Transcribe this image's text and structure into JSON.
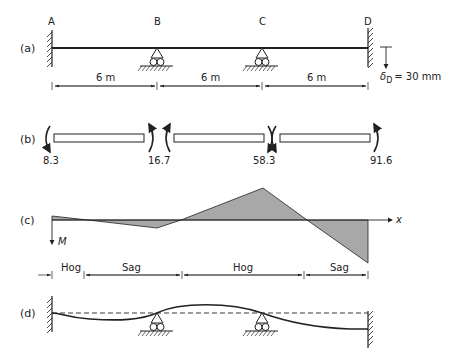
{
  "panels": {
    "a": {
      "label": "(a)",
      "nodes": [
        "A",
        "B",
        "C",
        "D"
      ],
      "spans": [
        "6 m",
        "6 m",
        "6 m"
      ],
      "settlement": {
        "symbol": "δ",
        "subscript": "D",
        "value": "= 30 mm"
      }
    },
    "b": {
      "label": "(b)",
      "moments": [
        "8.3",
        "16.7",
        "58.3",
        "91.6"
      ]
    },
    "c": {
      "label": "(c)",
      "axis_x": "x",
      "axis_m": "M",
      "regions": [
        "Hog",
        "Sag",
        "Hog",
        "Sag"
      ]
    },
    "d": {
      "label": "(d)"
    }
  },
  "colors": {
    "line": "#222222",
    "fill": "#a8a8a8",
    "background": "#ffffff"
  }
}
